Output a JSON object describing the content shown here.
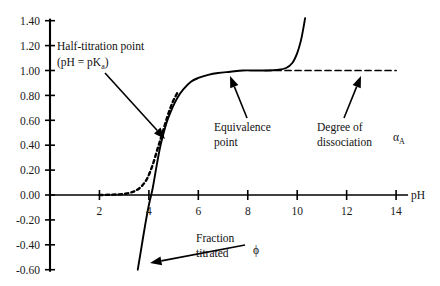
{
  "chart_data": {
    "type": "line",
    "title": "",
    "xlabel": "pH",
    "ylabel": "",
    "xlim": [
      0,
      14.4
    ],
    "ylim": [
      -0.6,
      1.4
    ],
    "grid": false,
    "legend": "none",
    "xticks": [
      "2",
      "4",
      "6",
      "8",
      "10",
      "12",
      "14"
    ],
    "xtick_values": [
      2,
      4,
      6,
      8,
      10,
      12,
      14
    ],
    "yticks": [
      "1.40",
      "1.20",
      "1.00",
      "0.80",
      "0.60",
      "0.40",
      "0.20",
      "0.00",
      "-0.20",
      "-0.40",
      "-0.60"
    ],
    "ytick_values": [
      1.4,
      1.2,
      1.0,
      0.8,
      0.6,
      0.4,
      0.2,
      0.0,
      -0.2,
      -0.4,
      -0.6
    ],
    "series": [
      {
        "name": "Fraction titrated",
        "style": "solid",
        "points": [
          [
            3.55,
            -0.6
          ],
          [
            3.7,
            -0.42
          ],
          [
            3.85,
            -0.24
          ],
          [
            4.0,
            -0.08
          ],
          [
            4.15,
            0.05
          ],
          [
            4.3,
            0.22
          ],
          [
            4.45,
            0.38
          ],
          [
            4.6,
            0.5
          ],
          [
            4.75,
            0.6
          ],
          [
            4.95,
            0.7
          ],
          [
            5.15,
            0.78
          ],
          [
            5.4,
            0.85
          ],
          [
            5.7,
            0.91
          ],
          [
            6.0,
            0.94
          ],
          [
            6.4,
            0.965
          ],
          [
            6.8,
            0.98
          ],
          [
            7.3,
            0.99
          ],
          [
            7.8,
            1.0
          ],
          [
            8.3,
            1.0
          ],
          [
            8.8,
            1.0
          ],
          [
            9.2,
            1.005
          ],
          [
            9.55,
            1.02
          ],
          [
            9.8,
            1.06
          ],
          [
            10.0,
            1.14
          ],
          [
            10.15,
            1.24
          ],
          [
            10.25,
            1.34
          ],
          [
            10.32,
            1.42
          ]
        ]
      },
      {
        "name": "Degree of dissociation",
        "style": "dotted",
        "points": [
          [
            2.0,
            0.0
          ],
          [
            2.4,
            0.002
          ],
          [
            2.8,
            0.005
          ],
          [
            3.1,
            0.012
          ],
          [
            3.35,
            0.025
          ],
          [
            3.55,
            0.045
          ],
          [
            3.75,
            0.08
          ],
          [
            3.95,
            0.14
          ],
          [
            4.15,
            0.24
          ],
          [
            4.35,
            0.37
          ],
          [
            4.55,
            0.5
          ],
          [
            4.75,
            0.63
          ],
          [
            4.95,
            0.74
          ],
          [
            5.15,
            0.82
          ]
        ]
      },
      {
        "name": "Asymptote at 1.00",
        "style": "dashed",
        "points": [
          [
            8.7,
            1.0
          ],
          [
            14.0,
            1.0
          ]
        ]
      }
    ],
    "annotations": [
      {
        "id": "half-titration",
        "line1": "Half-titration point",
        "line2_pre": "(pH = pK",
        "line2_sub": "a",
        "line2_post": ")",
        "arrow_from": [
          105,
          73
        ],
        "arrow_to": [
          165,
          139
        ]
      },
      {
        "id": "equivalence",
        "line1": "Equivalence",
        "line2": "point",
        "arrow_from": [
          247,
          118
        ],
        "arrow_to": [
          230,
          76
        ]
      },
      {
        "id": "degree-of-dissociation",
        "line1": "Degree of",
        "line2": "dissociation",
        "symbol": "α",
        "symbol_sub": "A",
        "arrow_from": [
          344,
          118
        ],
        "arrow_to": [
          361,
          76
        ]
      },
      {
        "id": "fraction-titrated",
        "line1": "Fraction",
        "line2": "titrated",
        "symbol": "ϕ",
        "arrow_from": [
          245,
          245
        ],
        "arrow_to": [
          150,
          263
        ]
      }
    ],
    "colors": {
      "axis": "#000000",
      "curve": "#000000",
      "background": "#ffffff"
    }
  }
}
